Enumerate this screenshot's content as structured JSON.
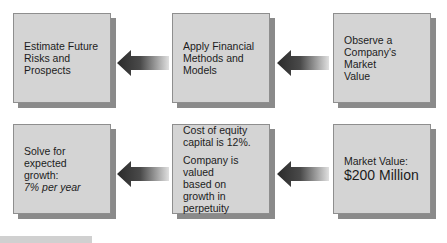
{
  "diagram": {
    "top_row": [
      {
        "id": "estimate",
        "lines": [
          "Estimate Future",
          "Risks and Prospects"
        ]
      },
      {
        "id": "apply",
        "lines": [
          "Apply Financial",
          "Methods and",
          "Models"
        ]
      },
      {
        "id": "observe",
        "lines": [
          "Observe a",
          "Company's Market",
          "Value"
        ]
      }
    ],
    "bottom_row": [
      {
        "id": "solve",
        "line1": "Solve for expected",
        "line2": "growth:",
        "italic": "7% per year"
      },
      {
        "id": "cost",
        "para1_line1": "Cost of equity",
        "para1_line2": "capital is 12%.",
        "para2_line1": "Company is valued",
        "para2_line2": "based on growth in",
        "para2_line3": "perpetuity"
      },
      {
        "id": "market",
        "label": "Market Value:",
        "value": "$200 Million"
      }
    ],
    "arrows": [
      {
        "id": "arrow-top-1",
        "direction": "left",
        "from": "apply",
        "to": "estimate"
      },
      {
        "id": "arrow-top-2",
        "direction": "left",
        "from": "observe",
        "to": "apply"
      },
      {
        "id": "arrow-bottom-1",
        "direction": "left",
        "from": "cost",
        "to": "solve"
      },
      {
        "id": "arrow-bottom-2",
        "direction": "left",
        "from": "market",
        "to": "cost"
      }
    ],
    "colors": {
      "box_fill": "#d4d4d4",
      "box_shadow": "#8a8a8a",
      "arrow_dark": "#2e2e2e",
      "arrow_light": "#d8d8d8",
      "text": "#1c1c1c"
    }
  }
}
